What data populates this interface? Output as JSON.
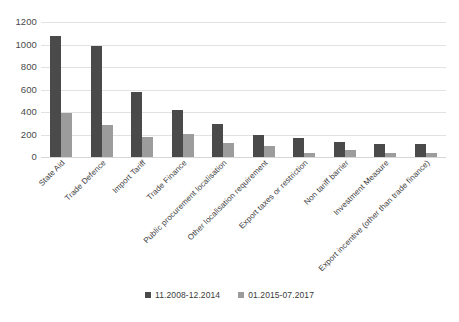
{
  "chart_data": {
    "type": "bar",
    "title": "",
    "xlabel": "",
    "ylabel": "",
    "ylim": [
      0,
      1200
    ],
    "yticks": [
      0,
      200,
      400,
      600,
      800,
      1000,
      1200
    ],
    "grid": true,
    "legend_position": "bottom",
    "categories": [
      "State Aid",
      "Trade Defence",
      "Import Tariff",
      "Trade Finance",
      "Public procurement localisation",
      "Other localisation requirement",
      "Export taxes or restriction",
      "Non tariff barrier",
      "Investment Measure",
      "Export incentive (other than trade finance)"
    ],
    "series": [
      {
        "name": "11.2008-12.2014",
        "color": "#4a4a4a",
        "values": [
          1080,
          985,
          575,
          418,
          290,
          200,
          170,
          133,
          115,
          115
        ]
      },
      {
        "name": "01.2015-07.2017",
        "color": "#9c9c9c",
        "values": [
          392,
          288,
          178,
          208,
          125,
          95,
          40,
          58,
          40,
          32
        ]
      }
    ]
  },
  "legend": {
    "items": [
      {
        "label": "11.2008-12.2014"
      },
      {
        "label": "01.2015-07.2017"
      }
    ]
  }
}
